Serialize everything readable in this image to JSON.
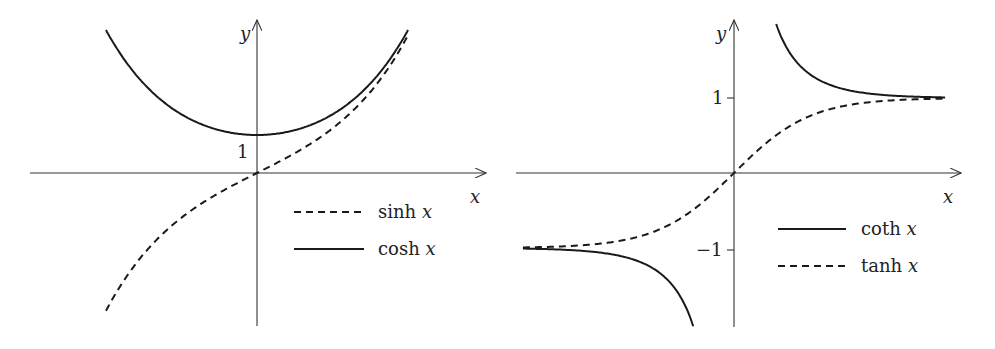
{
  "chart_data": [
    {
      "type": "line",
      "title": "",
      "xlabel": "x",
      "ylabel": "y",
      "xlim": [
        -2.0,
        2.0
      ],
      "ylim": [
        -4.0,
        4.0
      ],
      "grid": false,
      "legend_position": "lower right",
      "ticks": {
        "y": [
          {
            "value": 1,
            "label": "1"
          }
        ]
      },
      "series": [
        {
          "name": "sinh x",
          "function": "sinh",
          "style": "dashed",
          "x": [
            -2,
            -1.5,
            -1,
            -0.5,
            0,
            0.5,
            1,
            1.5,
            2
          ],
          "values": [
            -3.63,
            -2.13,
            -1.18,
            -0.52,
            0,
            0.52,
            1.18,
            2.13,
            3.63
          ]
        },
        {
          "name": "cosh x",
          "function": "cosh",
          "style": "solid",
          "x": [
            -2,
            -1.5,
            -1,
            -0.5,
            0,
            0.5,
            1,
            1.5,
            2
          ],
          "values": [
            3.76,
            2.35,
            1.54,
            1.13,
            1,
            1.13,
            1.54,
            2.35,
            3.76
          ]
        }
      ],
      "legend": [
        {
          "label": "sinh x",
          "func": "sinh",
          "style": "dashed"
        },
        {
          "label": "cosh x",
          "func": "cosh",
          "style": "solid"
        }
      ]
    },
    {
      "type": "line",
      "title": "",
      "xlabel": "x",
      "ylabel": "y",
      "xlim": [
        -2.77,
        2.77
      ],
      "ylim": [
        -2.05,
        2.05
      ],
      "grid": false,
      "legend_position": "lower right",
      "ticks": {
        "y": [
          {
            "value": 1,
            "label": "1"
          },
          {
            "value": -1,
            "label": "−1"
          }
        ]
      },
      "series": [
        {
          "name": "coth x",
          "function": "coth",
          "style": "solid",
          "x": [
            -2.77,
            -2,
            -1,
            -0.55,
            0.55,
            1,
            2,
            2.77
          ],
          "values": [
            -1.01,
            -1.04,
            -1.31,
            -2.0,
            2.0,
            1.31,
            1.04,
            1.01
          ]
        },
        {
          "name": "tanh x",
          "function": "tanh",
          "style": "dashed",
          "x": [
            -2.77,
            -2,
            -1,
            -0.5,
            0,
            0.5,
            1,
            2,
            2.77
          ],
          "values": [
            -0.99,
            -0.96,
            -0.76,
            -0.46,
            0,
            0.46,
            0.76,
            0.96,
            0.99
          ]
        }
      ],
      "legend": [
        {
          "label": "coth x",
          "func": "coth",
          "style": "solid"
        },
        {
          "label": "tanh x",
          "func": "tanh",
          "style": "dashed"
        }
      ]
    }
  ],
  "panels": [
    {
      "origin": [
        257,
        173
      ],
      "xscale": 75.5,
      "yscale": 38,
      "xaxis": [
        30,
        486
      ],
      "yaxis": [
        326,
        20
      ],
      "xlabel_pos": [
        470,
        203
      ],
      "ylabel_pos": [
        240,
        40
      ],
      "tick_labels": [
        {
          "text": "1",
          "x": 237,
          "y": 158,
          "tick": false
        }
      ],
      "legend_x": [
        294,
        364
      ],
      "legend_text_x": 378,
      "legend_y": [
        212,
        249
      ]
    },
    {
      "origin": [
        734,
        173
      ],
      "xscale": 76.2,
      "yscale": 75,
      "xaxis": [
        516,
        961
      ],
      "yaxis": [
        327,
        20
      ],
      "xlabel_pos": [
        943,
        203
      ],
      "ylabel_pos": [
        716,
        40
      ],
      "tick_labels": [
        {
          "text": "1",
          "x": 712,
          "y": 104,
          "tick": true,
          "ty": 98
        },
        {
          "text": "−1",
          "x": 696,
          "y": 256,
          "tick": true,
          "ty": 250
        }
      ],
      "legend_x": [
        778,
        846
      ],
      "legend_text_x": 861,
      "legend_y": [
        229,
        266
      ]
    }
  ]
}
